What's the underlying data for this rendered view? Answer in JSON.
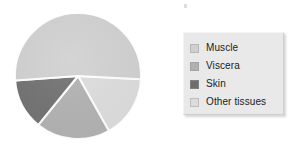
{
  "figure": {
    "background": "#ffffff",
    "speck_mark": "stray-speck"
  },
  "legend": {
    "position": "right",
    "background": "#e9e9e9",
    "items": [
      {
        "label": "Muscle",
        "color": "#d0d0d0"
      },
      {
        "label": "Viscera",
        "color": "#b0b0b0"
      },
      {
        "label": "Skin",
        "color": "#6e6e6e"
      },
      {
        "label": "Other tissues",
        "color": "#dcdcdc"
      }
    ]
  },
  "chart_data": {
    "type": "pie",
    "title": "",
    "xlabel": "",
    "ylabel": "",
    "grid": false,
    "legend_position": "right",
    "labels": [
      "Muscle",
      "Viscera",
      "Skin",
      "Other tissues"
    ],
    "values": [
      52,
      19,
      13,
      16
    ],
    "unit": "%",
    "colors": [
      "#d0d0d0",
      "#b0b0b0",
      "#6e6e6e",
      "#dcdcdc"
    ],
    "slice_order_clockwise": [
      "Other tissues",
      "Viscera",
      "Skin",
      "Muscle"
    ],
    "start_angle_deg": 3,
    "separator_color": "#ffffff",
    "separator_width_px": 2,
    "center_px": [
      64,
      64
    ],
    "radius_px": 63
  }
}
